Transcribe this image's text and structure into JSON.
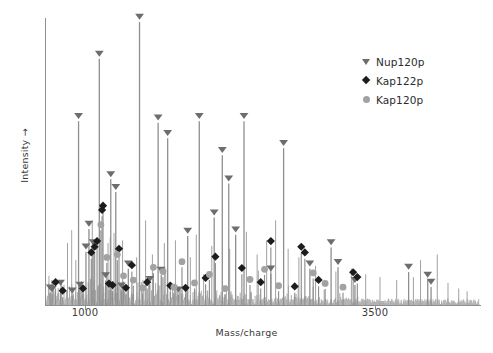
{
  "chart_data": {
    "type": "line",
    "title": "",
    "subtitle": "",
    "xlabel": "Mass/charge",
    "ylabel": "Intensity →",
    "xticks": [
      1000,
      3500
    ],
    "xtick_labels": [
      "1000",
      "3500"
    ],
    "yticks": [],
    "ytick_labels": [],
    "grid": false,
    "legend_position": "top-right",
    "axis_color": "#8a8a8a",
    "trace_color": "#9e9e9e",
    "series": [
      {
        "name": "mass spectrum",
        "description": "MALDI mass spectrum trace, intensity vs mass/charge",
        "x_range": [
          620,
          4250
        ],
        "y_range": [
          0,
          1.0
        ]
      }
    ],
    "legend": [
      {
        "label": "Nup120p",
        "marker": "triangle-down",
        "color": "#6d6d6d"
      },
      {
        "label": "Kap122p",
        "marker": "diamond",
        "color": "#1c1c1c"
      },
      {
        "label": "Kap120p",
        "marker": "circle",
        "color": "#a2a2a2"
      }
    ],
    "annotated_peaks": {
      "Nup120p": [
        {
          "x": 655,
          "height": 0.045
        },
        {
          "x": 672,
          "height": 0.04
        },
        {
          "x": 742,
          "height": 0.062
        },
        {
          "x": 840,
          "height": 0.035
        },
        {
          "x": 893,
          "height": 0.65
        },
        {
          "x": 905,
          "height": 0.055
        },
        {
          "x": 955,
          "height": 0.19
        },
        {
          "x": 980,
          "height": 0.27
        },
        {
          "x": 1015,
          "height": 0.205
        },
        {
          "x": 1067,
          "height": 0.87
        },
        {
          "x": 1120,
          "height": 0.088
        },
        {
          "x": 1163,
          "height": 0.445
        },
        {
          "x": 1205,
          "height": 0.4
        },
        {
          "x": 1252,
          "height": 0.052
        },
        {
          "x": 1310,
          "height": 0.13
        },
        {
          "x": 1404,
          "height": 1.0
        },
        {
          "x": 1490,
          "height": 0.075
        },
        {
          "x": 1560,
          "height": 0.645
        },
        {
          "x": 1586,
          "height": 0.108
        },
        {
          "x": 1640,
          "height": 0.59
        },
        {
          "x": 1730,
          "height": 0.038
        },
        {
          "x": 1808,
          "height": 0.245
        },
        {
          "x": 1905,
          "height": 0.65
        },
        {
          "x": 2030,
          "height": 0.31
        },
        {
          "x": 2098,
          "height": 0.53
        },
        {
          "x": 2152,
          "height": 0.43
        },
        {
          "x": 2210,
          "height": 0.25
        },
        {
          "x": 2280,
          "height": 0.65
        },
        {
          "x": 2505,
          "height": 0.112
        },
        {
          "x": 2612,
          "height": 0.555
        },
        {
          "x": 2832,
          "height": 0.13
        },
        {
          "x": 3010,
          "height": 0.205
        },
        {
          "x": 3068,
          "height": 0.135
        },
        {
          "x": 3210,
          "height": 0.072
        },
        {
          "x": 3660,
          "height": 0.118
        },
        {
          "x": 3820,
          "height": 0.09
        },
        {
          "x": 3848,
          "height": 0.065
        }
      ],
      "Kap122p": [
        {
          "x": 700,
          "height": 0.06
        },
        {
          "x": 760,
          "height": 0.03
        },
        {
          "x": 930,
          "height": 0.038
        },
        {
          "x": 1000,
          "height": 0.165
        },
        {
          "x": 1028,
          "height": 0.185
        },
        {
          "x": 1048,
          "height": 0.205
        },
        {
          "x": 1090,
          "height": 0.315
        },
        {
          "x": 1098,
          "height": 0.33
        },
        {
          "x": 1148,
          "height": 0.055
        },
        {
          "x": 1178,
          "height": 0.05
        },
        {
          "x": 1232,
          "height": 0.178
        },
        {
          "x": 1290,
          "height": 0.04
        },
        {
          "x": 1340,
          "height": 0.12
        },
        {
          "x": 1468,
          "height": 0.06
        },
        {
          "x": 1662,
          "height": 0.048
        },
        {
          "x": 1790,
          "height": 0.04
        },
        {
          "x": 1958,
          "height": 0.075
        },
        {
          "x": 2040,
          "height": 0.15
        },
        {
          "x": 2262,
          "height": 0.11
        },
        {
          "x": 2420,
          "height": 0.06
        },
        {
          "x": 2505,
          "height": 0.205
        },
        {
          "x": 2705,
          "height": 0.045
        },
        {
          "x": 2760,
          "height": 0.185
        },
        {
          "x": 2790,
          "height": 0.165
        },
        {
          "x": 2905,
          "height": 0.068
        },
        {
          "x": 3195,
          "height": 0.095
        },
        {
          "x": 3230,
          "height": 0.078
        }
      ],
      "Kap120p": [
        {
          "x": 1080,
          "height": 0.265
        },
        {
          "x": 1130,
          "height": 0.15
        },
        {
          "x": 1218,
          "height": 0.16
        },
        {
          "x": 1270,
          "height": 0.085
        },
        {
          "x": 1352,
          "height": 0.07
        },
        {
          "x": 1430,
          "height": 0.042
        },
        {
          "x": 1520,
          "height": 0.115
        },
        {
          "x": 1600,
          "height": 0.1
        },
        {
          "x": 1692,
          "height": 0.045
        },
        {
          "x": 1760,
          "height": 0.135
        },
        {
          "x": 1865,
          "height": 0.06
        },
        {
          "x": 1990,
          "height": 0.09
        },
        {
          "x": 2120,
          "height": 0.04
        },
        {
          "x": 2330,
          "height": 0.072
        },
        {
          "x": 2452,
          "height": 0.108
        },
        {
          "x": 2570,
          "height": 0.05
        },
        {
          "x": 2860,
          "height": 0.095
        },
        {
          "x": 2960,
          "height": 0.058
        },
        {
          "x": 3110,
          "height": 0.045
        }
      ]
    }
  },
  "axes": {
    "xlabel": "Mass/charge",
    "ylabel": "Intensity →",
    "xtick_1": "1000",
    "xtick_2": "3500"
  },
  "legend": {
    "items": [
      {
        "label": "Nup120p",
        "icon": "triangle-down-marker"
      },
      {
        "label": "Kap122p",
        "icon": "diamond-marker"
      },
      {
        "label": "Kap120p",
        "icon": "circle-marker"
      }
    ]
  }
}
